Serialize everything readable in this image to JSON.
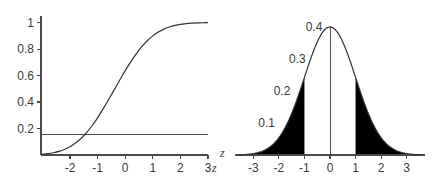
{
  "figure": {
    "background_color": "#ffffff",
    "width": 436,
    "height": 185,
    "panel_count": 2
  },
  "chart_data": [
    {
      "id": "left-panel",
      "type": "line",
      "title": "",
      "subtitle": "",
      "xlabel": "z",
      "ylabel": "",
      "xlim": [
        -3.05,
        3.0
      ],
      "ylim": [
        0,
        1.05
      ],
      "xticks": [
        -2,
        -1,
        0,
        1,
        2,
        3
      ],
      "xtick_labels": [
        "-2",
        "-1",
        "0",
        "1",
        "2",
        "3"
      ],
      "yticks": [
        0.2,
        0.4,
        0.6,
        0.8,
        1
      ],
      "ytick_labels": [
        "0.2",
        "0.4",
        "0.6",
        "0.8",
        "1"
      ],
      "grid": false,
      "legend": false,
      "legend_position": "none",
      "series": [
        {
          "name": "cumulative-normal-curve",
          "kind": "line",
          "color": "#333333",
          "description": "S-shaped cumulative distribution rising from 0 to 1",
          "x": [
            -3.0,
            -2.8,
            -2.6,
            -2.4,
            -2.2,
            -2.0,
            -1.8,
            -1.6,
            -1.4,
            -1.2,
            -1.0,
            -0.8,
            -0.6,
            -0.4,
            -0.2,
            0.0,
            0.2,
            0.4,
            0.6,
            0.8,
            1.0,
            1.2,
            1.4,
            1.6,
            1.8,
            2.0,
            2.2,
            2.4,
            2.6,
            2.8,
            3.0
          ],
          "y": [
            0.006,
            0.01,
            0.017,
            0.027,
            0.042,
            0.062,
            0.09,
            0.125,
            0.169,
            0.221,
            0.281,
            0.348,
            0.419,
            0.492,
            0.565,
            0.637,
            0.704,
            0.764,
            0.818,
            0.863,
            0.9,
            0.929,
            0.951,
            0.967,
            0.979,
            0.987,
            0.992,
            0.996,
            0.998,
            0.999,
            1.0
          ]
        },
        {
          "name": "horizontal-reference-line",
          "kind": "hline",
          "color": "#4a4a4a",
          "description": "Horizontal reference line drawn across the plot",
          "y_value": 0.155
        }
      ]
    },
    {
      "id": "right-panel",
      "type": "area",
      "title": "",
      "subtitle": "",
      "xlabel": "z",
      "ylabel": "",
      "xlim": [
        -3.6,
        3.6
      ],
      "ylim": [
        0,
        0.43
      ],
      "xticks": [
        -3,
        -2,
        -1,
        0,
        1,
        2,
        3
      ],
      "xtick_labels": [
        "-3",
        "-2",
        "-1",
        "0",
        "1",
        "2",
        "3"
      ],
      "yticks": [
        0.1,
        0.2,
        0.3,
        0.4
      ],
      "ytick_labels": [
        "0.1",
        "0.2",
        "0.3",
        "0.4"
      ],
      "ytick_label_style": "staggered-inside-no-axis",
      "grid": false,
      "legend": false,
      "legend_position": "none",
      "series": [
        {
          "name": "standard-normal-density",
          "kind": "line",
          "color": "#333333",
          "description": "Standard normal probability density curve, peak 0.399 at z=0",
          "x": [
            -3.6,
            -3.2,
            -2.8,
            -2.4,
            -2.0,
            -1.6,
            -1.2,
            -0.8,
            -0.4,
            0.0,
            0.4,
            0.8,
            1.2,
            1.6,
            2.0,
            2.4,
            2.8,
            3.2,
            3.6
          ],
          "y": [
            0.0006,
            0.0024,
            0.0079,
            0.0224,
            0.054,
            0.1109,
            0.1942,
            0.2897,
            0.3683,
            0.3989,
            0.3683,
            0.2897,
            0.1942,
            0.1109,
            0.054,
            0.0224,
            0.0079,
            0.0024,
            0.0006
          ]
        },
        {
          "name": "left-tail-shaded-region",
          "kind": "area",
          "color": "#000000",
          "description": "Filled black tail region below z = -1",
          "x_range": [
            -3.6,
            -1.0
          ]
        },
        {
          "name": "right-tail-shaded-region",
          "kind": "area",
          "color": "#000000",
          "description": "Filled black tail region above z = 1",
          "x_range": [
            1.0,
            3.6
          ]
        },
        {
          "name": "center-vertical-line",
          "kind": "vline",
          "color": "#555555",
          "description": "Vertical line at z = 0 from baseline to the curve peak",
          "x_value": 0
        }
      ]
    }
  ]
}
